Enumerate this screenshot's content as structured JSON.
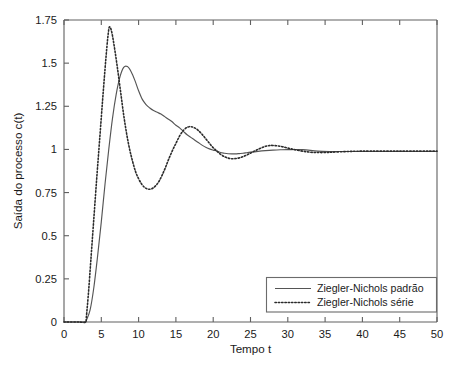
{
  "chart_data": {
    "type": "line",
    "title": "",
    "xlabel": "Tempo  t",
    "ylabel": "Saída do processo c(t)",
    "xlim": [
      0,
      50
    ],
    "ylim": [
      0,
      1.75
    ],
    "grid": false,
    "legend_position": "lower right",
    "xticks": [
      0,
      5,
      10,
      15,
      20,
      25,
      30,
      35,
      40,
      45,
      50
    ],
    "xtick_labels": [
      "0",
      "5",
      "10",
      "15",
      "20",
      "25",
      "30",
      "35",
      "40",
      "45",
      "50"
    ],
    "yticks": [
      0,
      0.25,
      0.5,
      0.75,
      1,
      1.25,
      1.5,
      1.75
    ],
    "ytick_labels": [
      "0",
      "0.25",
      "0.5",
      "0.75",
      "1",
      "1.25",
      "1.5",
      "1.75"
    ],
    "series": [
      {
        "name": "Ziegler-Nichols padrão",
        "style": "solid",
        "color": "#555555",
        "x": [
          0,
          1,
          2,
          2.9,
          3,
          3.5,
          4,
          4.5,
          5,
          5.5,
          6,
          6.5,
          7,
          7.5,
          8,
          8.5,
          9,
          9.5,
          10,
          10.5,
          11,
          11.5,
          12,
          12.5,
          13,
          13.5,
          14,
          14.5,
          15,
          15.5,
          16,
          16.5,
          17,
          17.5,
          18,
          18.5,
          19,
          19.5,
          20,
          20.5,
          21,
          21.5,
          22,
          22.5,
          23,
          23.5,
          24,
          24.5,
          25,
          26,
          27,
          28,
          29,
          30,
          32,
          34,
          36,
          38,
          40,
          45,
          50
        ],
        "y": [
          0,
          0,
          0,
          0,
          0.01,
          0.07,
          0.2,
          0.38,
          0.58,
          0.8,
          1.0,
          1.18,
          1.32,
          1.42,
          1.475,
          1.48,
          1.45,
          1.4,
          1.34,
          1.29,
          1.26,
          1.24,
          1.225,
          1.215,
          1.205,
          1.19,
          1.175,
          1.16,
          1.14,
          1.125,
          1.105,
          1.085,
          1.07,
          1.055,
          1.04,
          1.025,
          1.012,
          1.003,
          0.996,
          0.99,
          0.982,
          0.978,
          0.975,
          0.974,
          0.974,
          0.976,
          0.978,
          0.981,
          0.984,
          0.989,
          0.993,
          0.996,
          0.998,
          0.999,
          0.999,
          0.99,
          0.988,
          0.988,
          0.988,
          0.988,
          0.988
        ]
      },
      {
        "name": "Ziegler-Nichols série",
        "style": "dotted",
        "color": "#2b2b2b",
        "x": [
          0,
          1,
          2,
          2.9,
          3,
          3.3,
          3.6,
          4,
          4.4,
          4.8,
          5.2,
          5.6,
          5.9,
          6.1,
          6.4,
          6.8,
          7.2,
          7.6,
          8,
          8.4,
          8.8,
          9.2,
          9.6,
          10,
          10.4,
          10.8,
          11.2,
          11.6,
          12,
          12.4,
          12.8,
          13.2,
          13.6,
          14,
          14.5,
          15,
          15.5,
          16,
          16.5,
          17,
          17.5,
          18,
          18.5,
          19,
          19.5,
          20,
          20.5,
          21,
          21.5,
          22,
          22.5,
          23,
          23.5,
          24,
          24.5,
          25,
          25.5,
          26,
          26.5,
          27,
          27.5,
          28,
          29,
          30,
          31,
          32,
          33,
          34,
          35,
          36,
          38,
          40,
          45,
          50
        ],
        "y": [
          0,
          0,
          0,
          0,
          0.03,
          0.18,
          0.36,
          0.6,
          0.84,
          1.07,
          1.3,
          1.52,
          1.66,
          1.71,
          1.68,
          1.58,
          1.46,
          1.33,
          1.2,
          1.09,
          1.0,
          0.93,
          0.87,
          0.83,
          0.8,
          0.78,
          0.771,
          0.77,
          0.778,
          0.795,
          0.82,
          0.855,
          0.895,
          0.94,
          0.99,
          1.035,
          1.078,
          1.11,
          1.128,
          1.132,
          1.125,
          1.11,
          1.088,
          1.062,
          1.035,
          1.01,
          0.99,
          0.972,
          0.958,
          0.95,
          0.946,
          0.947,
          0.951,
          0.958,
          0.968,
          0.978,
          0.99,
          1.0,
          1.01,
          1.018,
          1.022,
          1.023,
          1.018,
          1.008,
          0.998,
          0.99,
          0.984,
          0.982,
          0.982,
          0.984,
          0.988,
          0.99,
          0.99,
          0.99
        ]
      }
    ]
  },
  "legend": {
    "entries": [
      {
        "label": "Ziegler-Nichols padrão",
        "style": "solid"
      },
      {
        "label": "Ziegler-Nichols série",
        "style": "dotted"
      }
    ]
  }
}
